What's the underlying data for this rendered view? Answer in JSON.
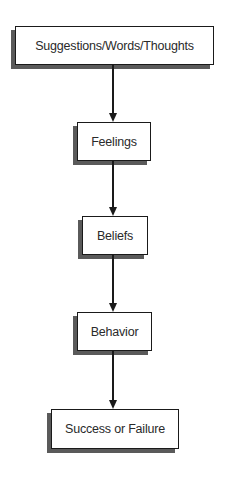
{
  "diagram": {
    "type": "flowchart",
    "direction": "top-to-bottom",
    "nodes": [
      {
        "id": "n1",
        "label": "Suggestions/Words/Thoughts"
      },
      {
        "id": "n2",
        "label": "Feelings"
      },
      {
        "id": "n3",
        "label": "Beliefs"
      },
      {
        "id": "n4",
        "label": "Behavior"
      },
      {
        "id": "n5",
        "label": "Success or Failure"
      }
    ],
    "edges": [
      {
        "from": "n1",
        "to": "n2"
      },
      {
        "from": "n2",
        "to": "n3"
      },
      {
        "from": "n3",
        "to": "n4"
      },
      {
        "from": "n4",
        "to": "n5"
      }
    ],
    "colors": {
      "border": "#1a1a1a",
      "shadow": "#5a5a5a",
      "text": "#2a2a2a",
      "background": "#ffffff"
    }
  }
}
